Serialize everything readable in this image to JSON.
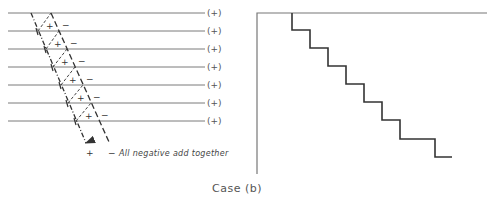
{
  "left_diagram": {
    "rows": [
      {
        "y": 13,
        "label": "(+)"
      },
      {
        "y": 31,
        "label": "(+)"
      },
      {
        "y": 49,
        "label": "(+)"
      },
      {
        "y": 67,
        "label": "(+)"
      },
      {
        "y": 85,
        "label": "(+)"
      },
      {
        "y": 103,
        "label": "(+)"
      },
      {
        "y": 121,
        "label": "(+)"
      }
    ],
    "inner_sign": "+",
    "outer_sign": "−",
    "bottom_plus": "+",
    "bottom_minus": "−",
    "annotation": "All negative add together"
  },
  "right_diagram": {
    "type": "step",
    "steps": [
      [
        292,
        13
      ],
      [
        292,
        30
      ],
      [
        310,
        30
      ],
      [
        310,
        48
      ],
      [
        328,
        48
      ],
      [
        328,
        66
      ],
      [
        346,
        66
      ],
      [
        346,
        84
      ],
      [
        364,
        84
      ],
      [
        364,
        102
      ],
      [
        382,
        102
      ],
      [
        382,
        120
      ],
      [
        400,
        120
      ],
      [
        400,
        139
      ],
      [
        435,
        139
      ],
      [
        435,
        157
      ],
      [
        452,
        157
      ]
    ]
  },
  "caption": "Case (b)"
}
